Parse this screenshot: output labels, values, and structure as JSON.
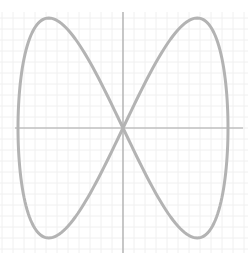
{
  "chart_data": {
    "type": "line",
    "title": "",
    "xlabel": "",
    "ylabel": "",
    "parametric": {
      "x": "cos(t)",
      "y": "sin(2t)",
      "t_range": [
        0,
        6.2832
      ]
    },
    "xlim": [
      -1.15,
      1.2
    ],
    "ylim": [
      -1.05,
      1.05
    ],
    "grid": true,
    "legend": null,
    "series": [
      {
        "name": "curve",
        "color": "#b3b3b3",
        "points": [
          [
            1.0,
            0.0
          ],
          [
            0.924,
            0.707
          ],
          [
            0.707,
            1.0
          ],
          [
            0.383,
            0.707
          ],
          [
            0.0,
            0.0
          ],
          [
            -0.383,
            -0.707
          ],
          [
            -0.707,
            -1.0
          ],
          [
            -0.924,
            -0.707
          ],
          [
            -1.0,
            0.0
          ],
          [
            -0.924,
            0.707
          ],
          [
            -0.707,
            1.0
          ],
          [
            -0.383,
            0.707
          ],
          [
            0.0,
            0.0
          ],
          [
            0.383,
            -0.707
          ],
          [
            0.707,
            -1.0
          ],
          [
            0.924,
            -0.707
          ],
          [
            1.0,
            0.0
          ]
        ]
      }
    ]
  },
  "style": {
    "curve_color": "#b3b3b3",
    "axis_color": "#a6a6a6",
    "grid_color": "#f0f0f0"
  },
  "geometry": {
    "center_x": 123,
    "center_y": 128,
    "x_scale": 105,
    "y_scale": 110,
    "grid_spacing": 11
  }
}
